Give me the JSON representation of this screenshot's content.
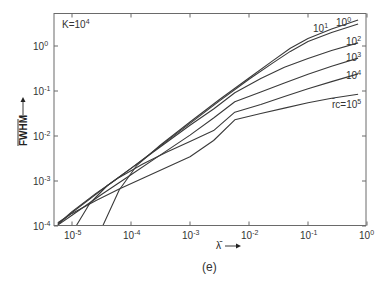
{
  "chart_data": {
    "type": "line",
    "title": "",
    "annotation": "K=10^4",
    "annotation_parts": {
      "base": "K=10",
      "exp": "4"
    },
    "xlabel": "λ̄",
    "ylabel": "FWHM (normalized)",
    "ylabel_text": "FWHM",
    "caption": "(e)",
    "xscale": "log",
    "yscale": "log",
    "xlim": [
      4.5e-06,
      1
    ],
    "ylim": [
      0.0001,
      5.4
    ],
    "grid": false,
    "x_ticks": [
      {
        "base": "10",
        "exp": "-5",
        "log": -5
      },
      {
        "base": "10",
        "exp": "-4",
        "log": -4
      },
      {
        "base": "10",
        "exp": "-3",
        "log": -3
      },
      {
        "base": "10",
        "exp": "-2",
        "log": -2
      },
      {
        "base": "10",
        "exp": "-1",
        "log": -1
      },
      {
        "base": "10",
        "exp": "0",
        "log": 0
      }
    ],
    "y_ticks": [
      {
        "base": "10",
        "exp": "0",
        "log": 0
      },
      {
        "base": "10",
        "exp": "-1",
        "log": -1
      },
      {
        "base": "10",
        "exp": "-2",
        "log": -2
      },
      {
        "base": "10",
        "exp": "-3",
        "log": -3
      },
      {
        "base": "10",
        "exp": "-4",
        "log": -4
      }
    ],
    "legend_position": "inline labels at right end of curves",
    "series": [
      {
        "name": "r̄c=10^0",
        "label_base": "10",
        "label_exp": "0",
        "points_log": [
          [
            -4.48,
            -4.0
          ],
          [
            -4.2,
            -3.2
          ],
          [
            -3.9,
            -2.65
          ],
          [
            -3.5,
            -2.2
          ],
          [
            -3.0,
            -1.69
          ],
          [
            -2.5,
            -1.19
          ],
          [
            -2.0,
            -0.71
          ],
          [
            -1.6,
            -0.33
          ],
          [
            -1.3,
            -0.05
          ],
          [
            -1.0,
            0.17
          ],
          [
            -0.6,
            0.38
          ],
          [
            -0.15,
            0.58
          ]
        ]
      },
      {
        "name": "r̄c=10^1",
        "label_base": "10",
        "label_exp": "1",
        "points_log": [
          [
            -4.93,
            -4.0
          ],
          [
            -4.7,
            -3.5
          ],
          [
            -4.4,
            -3.1
          ],
          [
            -4.0,
            -2.72
          ],
          [
            -3.5,
            -2.22
          ],
          [
            -3.0,
            -1.72
          ],
          [
            -2.5,
            -1.22
          ],
          [
            -2.0,
            -0.74
          ],
          [
            -1.6,
            -0.38
          ],
          [
            -1.3,
            -0.12
          ],
          [
            -1.0,
            0.1
          ],
          [
            -0.6,
            0.3
          ],
          [
            -0.15,
            0.49
          ]
        ]
      },
      {
        "name": "r̄c=10^2",
        "label_base": "10",
        "label_exp": "2",
        "points_log": [
          [
            -5.24,
            -3.97
          ],
          [
            -5.0,
            -3.7
          ],
          [
            -4.5,
            -3.2
          ],
          [
            -4.0,
            -2.72
          ],
          [
            -3.5,
            -2.24
          ],
          [
            -3.0,
            -1.76
          ],
          [
            -2.6,
            -1.4
          ],
          [
            -2.24,
            -1.04
          ],
          [
            -1.8,
            -0.72
          ],
          [
            -1.4,
            -0.47
          ],
          [
            -1.0,
            -0.28
          ],
          [
            -0.6,
            -0.1
          ],
          [
            -0.15,
            0.07
          ]
        ]
      },
      {
        "name": "r̄c=10^3",
        "label_base": "10",
        "label_exp": "3",
        "points_log": [
          [
            -5.24,
            -3.98
          ],
          [
            -5.0,
            -3.76
          ],
          [
            -4.5,
            -3.3
          ],
          [
            -4.0,
            -2.86
          ],
          [
            -3.5,
            -2.42
          ],
          [
            -3.0,
            -1.98
          ],
          [
            -2.6,
            -1.6
          ],
          [
            -2.24,
            -1.24
          ],
          [
            -1.8,
            -1.02
          ],
          [
            -1.4,
            -0.82
          ],
          [
            -1.0,
            -0.63
          ],
          [
            -0.6,
            -0.45
          ],
          [
            -0.15,
            -0.27
          ]
        ]
      },
      {
        "name": "r̄c=10^4",
        "label_base": "10",
        "label_exp": "4",
        "points_log": [
          [
            -5.24,
            -3.95
          ],
          [
            -5.0,
            -3.68
          ],
          [
            -4.6,
            -3.28
          ],
          [
            -4.2,
            -2.92
          ],
          [
            -3.8,
            -2.62
          ],
          [
            -3.4,
            -2.36
          ],
          [
            -3.0,
            -2.12
          ],
          [
            -2.6,
            -1.88
          ],
          [
            -2.24,
            -1.47
          ],
          [
            -1.8,
            -1.3
          ],
          [
            -1.4,
            -1.12
          ],
          [
            -1.0,
            -0.95
          ],
          [
            -0.6,
            -0.79
          ],
          [
            -0.15,
            -0.62
          ]
        ]
      },
      {
        "name": "r̄c=10^5",
        "label_base": "10",
        "label_exp": "5",
        "points_log": [
          [
            -5.24,
            -3.93
          ],
          [
            -5.0,
            -3.72
          ],
          [
            -4.6,
            -3.44
          ],
          [
            -4.2,
            -3.18
          ],
          [
            -3.8,
            -2.94
          ],
          [
            -3.4,
            -2.7
          ],
          [
            -3.0,
            -2.46
          ],
          [
            -2.6,
            -2.1
          ],
          [
            -2.24,
            -1.64
          ],
          [
            -1.8,
            -1.5
          ],
          [
            -1.4,
            -1.38
          ],
          [
            -1.0,
            -1.26
          ],
          [
            -0.6,
            -1.16
          ],
          [
            -0.15,
            -1.07
          ]
        ]
      }
    ],
    "curve_labels": [
      {
        "text_base": "10",
        "text_exp": "0",
        "x": 336,
        "y": 26
      },
      {
        "text_base": "10",
        "text_exp": "1",
        "x": 313,
        "y": 32
      },
      {
        "text_base": "10",
        "text_exp": "2",
        "x": 346,
        "y": 45
      },
      {
        "text_base": "10",
        "text_exp": "3",
        "x": 346,
        "y": 61
      },
      {
        "text_base": "10",
        "text_exp": "4",
        "x": 346,
        "y": 79
      },
      {
        "text_prefix": "r̄c=",
        "text_base": "10",
        "text_exp": "5",
        "x": 332,
        "y": 108
      }
    ]
  },
  "colors": {
    "axis": "#6a6a6a",
    "curve": "#3a3a3a",
    "text": "#333333",
    "background": "#ffffff"
  }
}
